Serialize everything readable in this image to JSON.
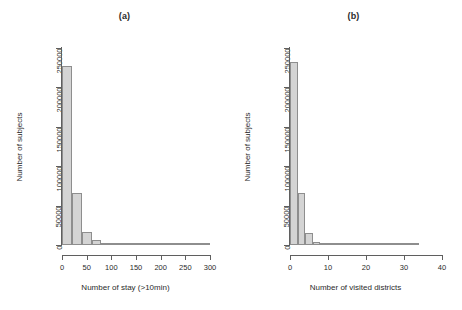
{
  "figure": {
    "background": "#ffffff",
    "bar_fill": "#d4d4d4",
    "bar_border": "#8e8e8e",
    "axis_color": "#5f5f5f"
  },
  "chart_data": [
    {
      "type": "bar",
      "panel": "a",
      "title": "(a)",
      "xlabel": "Number of stay (>10min)",
      "ylabel": "Number of subjects",
      "xlim": [
        0,
        300
      ],
      "ylim": [
        0,
        250000
      ],
      "xticks": [
        0,
        50,
        100,
        150,
        200,
        250,
        300
      ],
      "xtick_labels": [
        "0",
        "50",
        "100",
        "150",
        "200",
        "250",
        "300"
      ],
      "yticks": [
        0,
        50000,
        100000,
        150000,
        200000,
        250000
      ],
      "ytick_labels": [
        "0",
        "50000",
        "100000",
        "150000",
        "200000",
        "250000"
      ],
      "grid": false,
      "legend": null,
      "bin_width": 20,
      "bins": [
        {
          "x0": 0,
          "x1": 20,
          "value": 227000
        },
        {
          "x0": 20,
          "x1": 40,
          "value": 66000
        },
        {
          "x0": 40,
          "x1": 60,
          "value": 17000
        },
        {
          "x0": 60,
          "x1": 80,
          "value": 6200
        },
        {
          "x0": 80,
          "x1": 100,
          "value": 3000
        },
        {
          "x0": 100,
          "x1": 120,
          "value": 1500
        },
        {
          "x0": 120,
          "x1": 140,
          "value": 900
        },
        {
          "x0": 140,
          "x1": 160,
          "value": 520
        },
        {
          "x0": 160,
          "x1": 180,
          "value": 330
        },
        {
          "x0": 180,
          "x1": 200,
          "value": 220
        },
        {
          "x0": 200,
          "x1": 220,
          "value": 150
        },
        {
          "x0": 220,
          "x1": 240,
          "value": 110
        },
        {
          "x0": 240,
          "x1": 260,
          "value": 80
        },
        {
          "x0": 260,
          "x1": 280,
          "value": 60
        },
        {
          "x0": 280,
          "x1": 300,
          "value": 40
        }
      ]
    },
    {
      "type": "bar",
      "panel": "b",
      "title": "(b)",
      "xlabel": "Number of visited districts",
      "ylabel": "Number of subjects",
      "xlim": [
        0,
        40
      ],
      "ylim": [
        0,
        250000
      ],
      "xticks": [
        0,
        10,
        20,
        30,
        40
      ],
      "xtick_labels": [
        "0",
        "10",
        "20",
        "30",
        "40"
      ],
      "yticks": [
        0,
        50000,
        100000,
        150000,
        200000,
        250000
      ],
      "ytick_labels": [
        "0",
        "50000",
        "100000",
        "150000",
        "200000",
        "250000"
      ],
      "grid": false,
      "legend": null,
      "bin_width": 2,
      "bins": [
        {
          "x0": 0,
          "x1": 2,
          "value": 232000
        },
        {
          "x0": 2,
          "x1": 4,
          "value": 66000
        },
        {
          "x0": 4,
          "x1": 6,
          "value": 15000
        },
        {
          "x0": 6,
          "x1": 8,
          "value": 4200
        },
        {
          "x0": 8,
          "x1": 10,
          "value": 1500
        },
        {
          "x0": 10,
          "x1": 12,
          "value": 700
        },
        {
          "x0": 12,
          "x1": 14,
          "value": 400
        },
        {
          "x0": 14,
          "x1": 16,
          "value": 250
        },
        {
          "x0": 16,
          "x1": 18,
          "value": 170
        },
        {
          "x0": 18,
          "x1": 20,
          "value": 120
        },
        {
          "x0": 20,
          "x1": 22,
          "value": 90
        },
        {
          "x0": 22,
          "x1": 24,
          "value": 70
        },
        {
          "x0": 24,
          "x1": 26,
          "value": 55
        },
        {
          "x0": 26,
          "x1": 28,
          "value": 45
        },
        {
          "x0": 28,
          "x1": 30,
          "value": 35
        },
        {
          "x0": 30,
          "x1": 32,
          "value": 28
        },
        {
          "x0": 32,
          "x1": 34,
          "value": 20
        }
      ]
    }
  ]
}
